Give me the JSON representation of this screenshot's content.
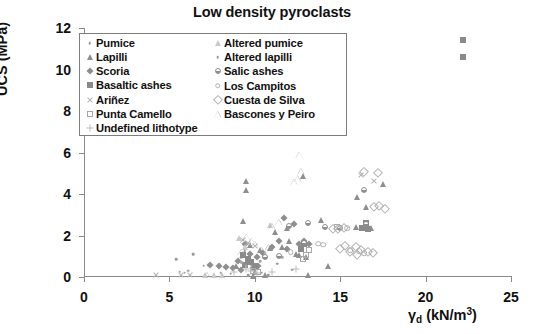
{
  "chart_data": {
    "type": "scatter",
    "title": "Low density pyroclasts",
    "xlabel": "γd (kN/m3)",
    "ylabel": "UCS (MPa)",
    "xlim": [
      0,
      25
    ],
    "ylim": [
      0,
      12
    ],
    "xticks": [
      0,
      5,
      10,
      15,
      20,
      25
    ],
    "yticks": [
      0,
      2,
      4,
      6,
      8,
      10,
      12
    ],
    "grid": false,
    "legend_position": "upper-left-inside",
    "series": [
      {
        "name": "Pumice",
        "marker": "dot",
        "color": "#9a9a9a",
        "points": [
          [
            6.4,
            1.1
          ],
          [
            5.4,
            0.85
          ],
          [
            7.0,
            0.55
          ],
          [
            8.0,
            0.2
          ],
          [
            9.4,
            1.25
          ],
          [
            9.2,
            0.95
          ],
          [
            9.8,
            0.6
          ],
          [
            10.0,
            0.35
          ],
          [
            8.6,
            0.15
          ],
          [
            9.0,
            0.45
          ],
          [
            10.4,
            0.2
          ],
          [
            11.3,
            0.65
          ],
          [
            12.2,
            0.35
          ],
          [
            9.6,
            0.1
          ],
          [
            10.8,
            0.1
          ]
        ]
      },
      {
        "name": "Lapilli",
        "marker": "triangle-filled",
        "color": "#8e8e8e",
        "points": [
          [
            9.5,
            4.65
          ],
          [
            9.5,
            4.2
          ],
          [
            9.3,
            2.7
          ],
          [
            11.2,
            2.15
          ],
          [
            12.0,
            1.75
          ],
          [
            11.6,
            1.45
          ],
          [
            12.4,
            1.1
          ],
          [
            13.0,
            0.95
          ],
          [
            13.9,
            2.75
          ],
          [
            14.3,
            0.55
          ],
          [
            13.1,
            0.1
          ],
          [
            16.0,
            3.85
          ],
          [
            16.5,
            3.35
          ],
          [
            17.5,
            4.5
          ],
          [
            16.4,
            2.45
          ],
          [
            16.8,
            2.35
          ],
          [
            15.9,
            2.4
          ],
          [
            10.0,
            0.25
          ],
          [
            10.6,
            0.1
          ],
          [
            9.9,
            0.05
          ],
          [
            12.8,
            4.85
          ],
          [
            11.9,
            2.35
          ],
          [
            10.9,
            1.4
          ],
          [
            12.6,
            1.05
          ],
          [
            8.9,
            0.55
          ],
          [
            9.7,
            1.55
          ],
          [
            10.3,
            1.3
          ]
        ]
      },
      {
        "name": "Scoria",
        "marker": "diamond-filled",
        "color": "#8e8e8e",
        "points": [
          [
            7.4,
            0.6
          ],
          [
            7.9,
            0.55
          ],
          [
            8.3,
            0.5
          ],
          [
            9.0,
            0.75
          ],
          [
            9.4,
            1.6
          ],
          [
            9.7,
            1.1
          ],
          [
            10.1,
            0.95
          ],
          [
            10.5,
            1.15
          ],
          [
            11.0,
            1.45
          ],
          [
            11.4,
            1.75
          ],
          [
            11.7,
            2.85
          ],
          [
            12.3,
            2.55
          ],
          [
            12.9,
            1.75
          ],
          [
            12.6,
            1.6
          ],
          [
            13.2,
            1.6
          ],
          [
            9.2,
            0.35
          ],
          [
            9.9,
            0.45
          ],
          [
            10.2,
            0.55
          ],
          [
            8.7,
            0.45
          ],
          [
            11.9,
            1.35
          ]
        ]
      },
      {
        "name": "Basaltic ashes",
        "marker": "square-filled",
        "color": "#8a8a8a",
        "points": [
          [
            22.2,
            11.4
          ],
          [
            22.2,
            10.6
          ],
          [
            9.6,
            0.85
          ],
          [
            9.8,
            0.7
          ],
          [
            10.0,
            0.55
          ],
          [
            12.9,
            1.6
          ],
          [
            12.7,
            1.35
          ],
          [
            16.5,
            2.6
          ],
          [
            16.6,
            2.3
          ],
          [
            16.3,
            2.35
          ],
          [
            9.4,
            0.6
          ],
          [
            9.3,
            1.05
          ]
        ]
      },
      {
        "name": "Ariñez",
        "marker": "x",
        "color": "#b4b4b4",
        "points": [
          [
            4.2,
            0.1
          ],
          [
            5.7,
            0.1
          ],
          [
            6.2,
            0.12
          ],
          [
            9.3,
            1.8
          ],
          [
            9.6,
            1.65
          ],
          [
            16.2,
            4.9
          ],
          [
            17.0,
            4.65
          ],
          [
            10.0,
            1.5
          ]
        ]
      },
      {
        "name": "Punta Camello",
        "marker": "square-open",
        "color": "#a8a8a8",
        "points": [
          [
            13.0,
            1.05
          ],
          [
            12.8,
            0.85
          ],
          [
            14.8,
            2.4
          ],
          [
            9.9,
            0.3
          ],
          [
            10.2,
            0.25
          ],
          [
            13.2,
            1.3
          ]
        ]
      },
      {
        "name": "Undefined lithotype",
        "marker": "plus",
        "color": "#bdbdbd",
        "points": [
          [
            9.5,
            0.4
          ],
          [
            9.8,
            0.3
          ],
          [
            10.1,
            0.2
          ],
          [
            11.0,
            0.25
          ],
          [
            12.4,
            0.4
          ],
          [
            8.8,
            0.25
          ]
        ]
      },
      {
        "name": "Altered pumice",
        "marker": "triangle-light",
        "color": "#c9c9c9",
        "points": [
          [
            7.1,
            0.1
          ],
          [
            7.6,
            0.12
          ],
          [
            9.1,
            1.9
          ],
          [
            9.4,
            1.45
          ],
          [
            10.6,
            1.05
          ],
          [
            10.9,
            2.5
          ],
          [
            8.1,
            0.1
          ]
        ]
      },
      {
        "name": "Altered lapilli",
        "marker": "dot",
        "color": "#a5a5a5",
        "points": [
          [
            5.6,
            0.25
          ],
          [
            5.9,
            0.2
          ],
          [
            6.1,
            0.3
          ],
          [
            9.2,
            0.7
          ],
          [
            9.5,
            0.55
          ],
          [
            10.3,
            0.75
          ],
          [
            11.6,
            0.95
          ]
        ]
      },
      {
        "name": "Salic ashes",
        "marker": "circle-half",
        "color": "#8e8e8e",
        "points": [
          [
            12.0,
            2.45
          ],
          [
            13.1,
            2.6
          ],
          [
            14.1,
            2.4
          ],
          [
            16.4,
            4.2
          ],
          [
            16.5,
            2.55
          ],
          [
            12.9,
            1.65
          ],
          [
            11.4,
            1.0
          ],
          [
            10.6,
            0.95
          ],
          [
            15.0,
            2.35
          ]
        ]
      },
      {
        "name": "Los Campitos",
        "marker": "circle-open",
        "color": "#b0b0b0",
        "points": [
          [
            13.7,
            1.6
          ],
          [
            14.0,
            1.55
          ],
          [
            15.4,
            2.35
          ],
          [
            16.1,
            1.25
          ],
          [
            16.4,
            1.15
          ],
          [
            15.6,
            1.3
          ],
          [
            12.1,
            1.2
          ]
        ]
      },
      {
        "name": "Cuesta de Silva",
        "marker": "diamond-open",
        "color": "#b2b2b2",
        "points": [
          [
            16.4,
            5.05
          ],
          [
            17.2,
            5.0
          ],
          [
            17.3,
            3.4
          ],
          [
            17.0,
            3.35
          ],
          [
            15.9,
            1.45
          ],
          [
            16.2,
            1.3
          ],
          [
            16.6,
            1.2
          ],
          [
            16.9,
            1.15
          ],
          [
            15.6,
            1.2
          ],
          [
            14.9,
            2.3
          ],
          [
            15.2,
            2.35
          ],
          [
            15.0,
            1.35
          ],
          [
            15.3,
            1.5
          ],
          [
            16.0,
            1.05
          ],
          [
            17.6,
            3.3
          ],
          [
            14.6,
            2.3
          ]
        ]
      },
      {
        "name": "Bascones y Peiro",
        "marker": "triangle-open",
        "color": "#b0b0b0",
        "points": [
          [
            12.6,
            5.9
          ],
          [
            12.7,
            5.1
          ],
          [
            12.5,
            4.75
          ],
          [
            12.3,
            4.6
          ],
          [
            11.4,
            2.65
          ],
          [
            11.0,
            2.45
          ],
          [
            9.5,
            1.95
          ],
          [
            9.8,
            1.75
          ],
          [
            10.0,
            1.6
          ],
          [
            9.2,
            1.2
          ],
          [
            7.2,
            0.1
          ],
          [
            8.0,
            0.12
          ],
          [
            10.4,
            1.3
          ],
          [
            10.8,
            1.45
          ]
        ]
      }
    ]
  },
  "legend": {
    "left_column": [
      {
        "label": "Pumice",
        "marker": "dot"
      },
      {
        "label": "Lapilli",
        "marker": "triangle-filled"
      },
      {
        "label": "Scoria",
        "marker": "diamond-filled"
      },
      {
        "label": "Basaltic ashes",
        "marker": "square-filled"
      },
      {
        "label": "Ariñez",
        "marker": "x"
      },
      {
        "label": "Punta Camello",
        "marker": "square-open"
      },
      {
        "label": "Undefined lithotype",
        "marker": "plus"
      }
    ],
    "right_column": [
      {
        "label": "Altered pumice",
        "marker": "triangle-light"
      },
      {
        "label": "Altered lapilli",
        "marker": "dot"
      },
      {
        "label": "Salic ashes",
        "marker": "circle-half"
      },
      {
        "label": "Los Campitos",
        "marker": "circle-open"
      },
      {
        "label": "Cuesta de Silva",
        "marker": "diamond-open"
      },
      {
        "label": "Bascones y Peiro",
        "marker": "triangle-open"
      }
    ]
  },
  "axis_text": {
    "x_label_symbol": "γ",
    "x_label_sub": "d",
    "x_label_unit_open": " (kN/m",
    "x_label_sup": "3",
    "x_label_unit_close": ")",
    "y_label": "UCS (MPa)"
  }
}
